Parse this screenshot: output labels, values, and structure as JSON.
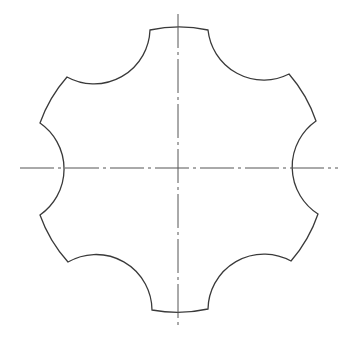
{
  "drawing": {
    "title": "",
    "description": "Technical drawing of a six-lobed part with circular concave notches and dash-dot centerlines",
    "colors": {
      "background": "#ffffff",
      "outline": "#3a3a3a",
      "centerline": "#555555"
    },
    "center": [
      178,
      168
    ],
    "outer_radius": 141,
    "notch_count": 6,
    "notch_radius": 56,
    "centerlines": {
      "horizontal": {
        "x1": 20,
        "x2": 338,
        "y": 168
      },
      "vertical": {
        "x": 178,
        "y1": 14,
        "y2": 326
      }
    }
  }
}
